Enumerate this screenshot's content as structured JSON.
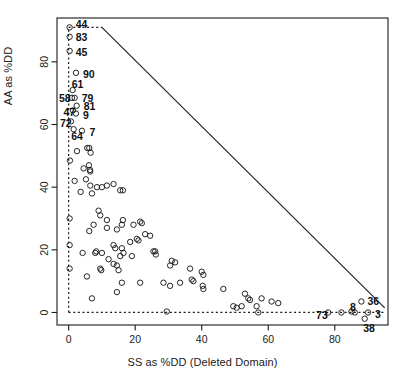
{
  "chart_data": {
    "type": "scatter",
    "title": "",
    "xlabel": "SS as %DD (Deleted Domain)",
    "ylabel": "AA as %DD",
    "xlim": [
      -3.5,
      96
    ],
    "ylim": [
      -4,
      94
    ],
    "xticks": [
      0,
      20,
      40,
      60,
      80
    ],
    "yticks": [
      0,
      20,
      40,
      60,
      80
    ],
    "xtick_labels": [
      "0",
      "20",
      "40",
      "60",
      "80"
    ],
    "ytick_labels": [
      "0",
      "20",
      "40",
      "60",
      "80"
    ],
    "grid": false,
    "legend": null,
    "marker": "open-circle",
    "marker_color": "#1a1a1a",
    "reference_lines": [
      {
        "name": "diagonal-boundary",
        "style": "solid",
        "color": "#1a1a1a",
        "from": [
          10,
          91
        ],
        "to": [
          95,
          1.5
        ]
      },
      {
        "name": "top-dotted-boundary",
        "style": "dotted",
        "color": "#1a1a1a",
        "from": [
          0,
          91
        ],
        "to": [
          10,
          91
        ]
      },
      {
        "name": "left-dotted-boundary",
        "style": "dotted",
        "color": "#1a1a1a",
        "from": [
          0,
          0
        ],
        "to": [
          0,
          91
        ]
      },
      {
        "name": "bottom-dotted-boundary",
        "style": "dotted",
        "color": "#1a1a1a",
        "from": [
          0,
          0
        ],
        "to": [
          95,
          0
        ]
      }
    ],
    "points": [
      {
        "x": 0.3,
        "y": 91.0,
        "label": "44"
      },
      {
        "x": 0.3,
        "y": 88.0,
        "label": "83"
      },
      {
        "x": 0.3,
        "y": 83.5,
        "label": "45"
      },
      {
        "x": 2.2,
        "y": 76.5,
        "label": "90"
      },
      {
        "x": 1.2,
        "y": 71.0,
        "label": "61"
      },
      {
        "x": 1.0,
        "y": 68.5,
        "label": "58"
      },
      {
        "x": 1.8,
        "y": 68.5,
        "label": "79"
      },
      {
        "x": 2.4,
        "y": 66.0,
        "label": "81"
      },
      {
        "x": 1.3,
        "y": 64.5,
        "label": "47"
      },
      {
        "x": 2.2,
        "y": 63.5,
        "label": "9"
      },
      {
        "x": 0.7,
        "y": 61.0,
        "label": "72"
      },
      {
        "x": 1.5,
        "y": 58.5,
        "label": "64"
      },
      {
        "x": 4.0,
        "y": 58.0,
        "label": "7"
      },
      {
        "x": 0.4,
        "y": 48.5,
        "label": null
      },
      {
        "x": 2.5,
        "y": 51.5,
        "label": null
      },
      {
        "x": 5.6,
        "y": 52.5,
        "label": null
      },
      {
        "x": 6.2,
        "y": 52.5,
        "label": null
      },
      {
        "x": 6.6,
        "y": 51.0,
        "label": null
      },
      {
        "x": 1.8,
        "y": 42.0,
        "label": null
      },
      {
        "x": 4.5,
        "y": 46.0,
        "label": null
      },
      {
        "x": 6.1,
        "y": 47.0,
        "label": null
      },
      {
        "x": 6.4,
        "y": 45.5,
        "label": null
      },
      {
        "x": 6.5,
        "y": 45.0,
        "label": null
      },
      {
        "x": 3.6,
        "y": 38.5,
        "label": null
      },
      {
        "x": 6.5,
        "y": 40.5,
        "label": null
      },
      {
        "x": 5.2,
        "y": 42.5,
        "label": null
      },
      {
        "x": 7.0,
        "y": 38.0,
        "label": null
      },
      {
        "x": 8.5,
        "y": 40.0,
        "label": null
      },
      {
        "x": 10.0,
        "y": 40.0,
        "label": null
      },
      {
        "x": 11.5,
        "y": 40.5,
        "label": null
      },
      {
        "x": 13.5,
        "y": 41.0,
        "label": null
      },
      {
        "x": 15.5,
        "y": 39.0,
        "label": null
      },
      {
        "x": 16.3,
        "y": 39.0,
        "label": null
      },
      {
        "x": 0.3,
        "y": 30.0,
        "label": null
      },
      {
        "x": 9.0,
        "y": 32.5,
        "label": null
      },
      {
        "x": 9.5,
        "y": 31.0,
        "label": null
      },
      {
        "x": 11.5,
        "y": 29.5,
        "label": null
      },
      {
        "x": 7.5,
        "y": 28.0,
        "label": null
      },
      {
        "x": 6.2,
        "y": 26.0,
        "label": null
      },
      {
        "x": 11.5,
        "y": 27.0,
        "label": null
      },
      {
        "x": 14.5,
        "y": 26.5,
        "label": null
      },
      {
        "x": 16.0,
        "y": 28.0,
        "label": null
      },
      {
        "x": 16.3,
        "y": 29.5,
        "label": null
      },
      {
        "x": 19.5,
        "y": 28.0,
        "label": null
      },
      {
        "x": 21.5,
        "y": 29.0,
        "label": null
      },
      {
        "x": 22.0,
        "y": 28.5,
        "label": null
      },
      {
        "x": 0.3,
        "y": 21.5,
        "label": null
      },
      {
        "x": 13.5,
        "y": 21.5,
        "label": null
      },
      {
        "x": 16.0,
        "y": 20.5,
        "label": null
      },
      {
        "x": 18.5,
        "y": 22.5,
        "label": null
      },
      {
        "x": 20.5,
        "y": 23.5,
        "label": null
      },
      {
        "x": 21.0,
        "y": 23.0,
        "label": null
      },
      {
        "x": 23.0,
        "y": 25.0,
        "label": null
      },
      {
        "x": 24.5,
        "y": 24.5,
        "label": null
      },
      {
        "x": 4.2,
        "y": 19.0,
        "label": null
      },
      {
        "x": 8.0,
        "y": 19.0,
        "label": null
      },
      {
        "x": 8.3,
        "y": 19.5,
        "label": null
      },
      {
        "x": 10.0,
        "y": 19.0,
        "label": null
      },
      {
        "x": 14.0,
        "y": 20.5,
        "label": null
      },
      {
        "x": 15.5,
        "y": 18.0,
        "label": null
      },
      {
        "x": 16.5,
        "y": 19.0,
        "label": null
      },
      {
        "x": 19.0,
        "y": 18.0,
        "label": null
      },
      {
        "x": 25.5,
        "y": 19.5,
        "label": null
      },
      {
        "x": 26.0,
        "y": 19.5,
        "label": null
      },
      {
        "x": 26.2,
        "y": 18.5,
        "label": null
      },
      {
        "x": 12.0,
        "y": 17.0,
        "label": null
      },
      {
        "x": 13.5,
        "y": 15.5,
        "label": null
      },
      {
        "x": 14.5,
        "y": 15.0,
        "label": null
      },
      {
        "x": 15.0,
        "y": 13.5,
        "label": null
      },
      {
        "x": 0.3,
        "y": 14.0,
        "label": null
      },
      {
        "x": 9.5,
        "y": 14.0,
        "label": null
      },
      {
        "x": 9.8,
        "y": 13.5,
        "label": null
      },
      {
        "x": 31.0,
        "y": 16.5,
        "label": null
      },
      {
        "x": 32.0,
        "y": 16.0,
        "label": null
      },
      {
        "x": 30.5,
        "y": 15.0,
        "label": null
      },
      {
        "x": 36.5,
        "y": 14.0,
        "label": null
      },
      {
        "x": 40.0,
        "y": 13.0,
        "label": null
      },
      {
        "x": 40.5,
        "y": 12.0,
        "label": null
      },
      {
        "x": 37.0,
        "y": 10.5,
        "label": null
      },
      {
        "x": 37.5,
        "y": 10.0,
        "label": null
      },
      {
        "x": 40.3,
        "y": 8.5,
        "label": null
      },
      {
        "x": 40.5,
        "y": 7.5,
        "label": null
      },
      {
        "x": 28.5,
        "y": 9.5,
        "label": null
      },
      {
        "x": 30.5,
        "y": 8.5,
        "label": null
      },
      {
        "x": 33.5,
        "y": 9.5,
        "label": null
      },
      {
        "x": 16.0,
        "y": 9.5,
        "label": null
      },
      {
        "x": 21.5,
        "y": 9.5,
        "label": null
      },
      {
        "x": 14.5,
        "y": 6.5,
        "label": null
      },
      {
        "x": 5.5,
        "y": 11.5,
        "label": null
      },
      {
        "x": 7.0,
        "y": 4.5,
        "label": null
      },
      {
        "x": 46.5,
        "y": 7.5,
        "label": null
      },
      {
        "x": 53.0,
        "y": 6.0,
        "label": null
      },
      {
        "x": 54.0,
        "y": 4.5,
        "label": null
      },
      {
        "x": 54.5,
        "y": 4.0,
        "label": null
      },
      {
        "x": 56.5,
        "y": 2.0,
        "label": null
      },
      {
        "x": 58.0,
        "y": 4.5,
        "label": null
      },
      {
        "x": 61.0,
        "y": 3.5,
        "label": null
      },
      {
        "x": 63.0,
        "y": 3.0,
        "label": null
      },
      {
        "x": 52.0,
        "y": 2.0,
        "label": null
      },
      {
        "x": 50.5,
        "y": 1.5,
        "label": null
      },
      {
        "x": 49.5,
        "y": 2.0,
        "label": null
      },
      {
        "x": 29.5,
        "y": 0.3,
        "label": null
      },
      {
        "x": 57.0,
        "y": 0.0,
        "label": null
      },
      {
        "x": 78.0,
        "y": 0.0,
        "label": "73"
      },
      {
        "x": 82.0,
        "y": 0.0,
        "label": null
      },
      {
        "x": 85.0,
        "y": 0.3,
        "label": "8"
      },
      {
        "x": 86.0,
        "y": 0.0,
        "label": null
      },
      {
        "x": 90.0,
        "y": 0.0,
        "label": "3"
      },
      {
        "x": 88.0,
        "y": 3.5,
        "label": "36"
      },
      {
        "x": 89.0,
        "y": -2.0,
        "label": "38"
      }
    ]
  }
}
